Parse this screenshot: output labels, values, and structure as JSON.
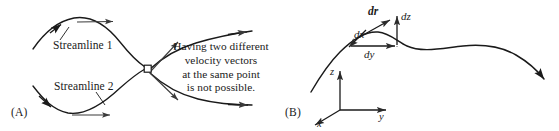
{
  "figure": {
    "background_color": "#ffffff",
    "stroke_color": "#1a1a1a",
    "width": 559,
    "height": 131
  },
  "panel_a": {
    "label": "(A)",
    "streamline_1_label": "Streamline 1",
    "streamline_2_label": "Streamline 2",
    "callout_lines": [
      "Having two different",
      "velocity vectors",
      "at the same point",
      "is not possible."
    ],
    "junction_marker": "open-square"
  },
  "panel_b": {
    "label": "(B)",
    "vector_label": "dr",
    "component_dz": "dz",
    "component_dx": "dx",
    "component_dy": "dy",
    "axis_z": "z",
    "axis_y": "y",
    "axis_x": "x"
  }
}
